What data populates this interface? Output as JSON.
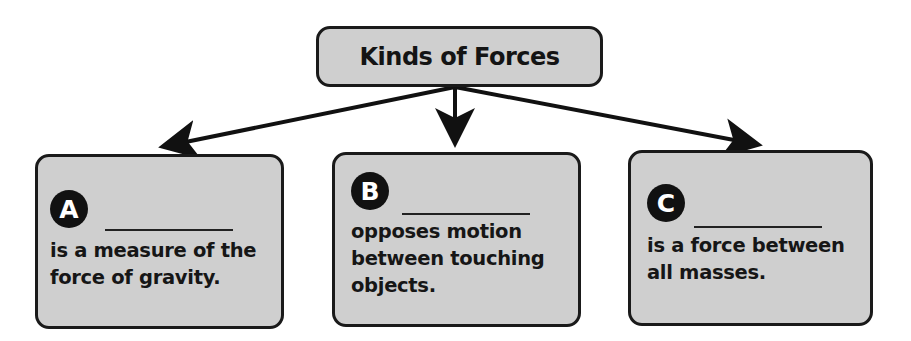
{
  "diagram": {
    "title": "Kinds of Forces",
    "colors": {
      "box_fill": "#cfcfcf",
      "box_border": "#1a1a1a",
      "badge_fill": "#111111",
      "badge_text": "#ffffff",
      "arrow": "#111111"
    },
    "cards": [
      {
        "letter": "A",
        "blank": "",
        "text": "is a measure of the\nforce of gravity."
      },
      {
        "letter": "B",
        "blank": "",
        "text": "opposes motion\nbetween touching\nobjects."
      },
      {
        "letter": "C",
        "blank": "",
        "text": "is a force between\nall masses."
      }
    ],
    "arrows": [
      {
        "from": "title",
        "to": "card-A"
      },
      {
        "from": "title",
        "to": "card-B"
      },
      {
        "from": "title",
        "to": "card-C"
      }
    ]
  }
}
